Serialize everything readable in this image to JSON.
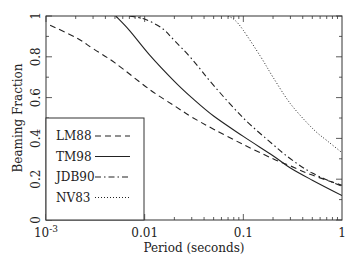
{
  "chart_data": {
    "type": "line",
    "title": "",
    "xlabel": "Period (seconds)",
    "ylabel": "Beaming Fraction",
    "xscale": "log",
    "xlim": [
      0.001,
      1
    ],
    "ylim": [
      0,
      1
    ],
    "grid": false,
    "legend_position": "lower-left",
    "x_ticks": [
      {
        "value": 0.001,
        "label": "10",
        "sup": "-3"
      },
      {
        "value": 0.01,
        "label": "0.01",
        "sup": ""
      },
      {
        "value": 0.1,
        "label": "0.1",
        "sup": ""
      },
      {
        "value": 1,
        "label": "1",
        "sup": ""
      }
    ],
    "y_ticks": [
      {
        "value": 0,
        "label": "0"
      },
      {
        "value": 0.2,
        "label": "0.2"
      },
      {
        "value": 0.4,
        "label": "0.4"
      },
      {
        "value": 0.6,
        "label": "0.6"
      },
      {
        "value": 0.8,
        "label": "0.8"
      },
      {
        "value": 1,
        "label": "1"
      }
    ],
    "series": [
      {
        "name": "LM88",
        "style": "dashed",
        "x": [
          0.0011,
          0.002,
          0.003,
          0.005,
          0.0112,
          0.02,
          0.03,
          0.05,
          0.1,
          0.2,
          0.3,
          0.5,
          1.0
        ],
        "y": [
          0.955,
          0.895,
          0.84,
          0.77,
          0.64,
          0.56,
          0.505,
          0.445,
          0.37,
          0.3,
          0.265,
          0.22,
          0.17
        ]
      },
      {
        "name": "TM98",
        "style": "solid",
        "x": [
          0.0051,
          0.007,
          0.0112,
          0.02,
          0.03,
          0.05,
          0.1,
          0.2,
          0.3,
          0.5,
          1.0
        ],
        "y": [
          1.0,
          0.93,
          0.81,
          0.68,
          0.6,
          0.51,
          0.41,
          0.315,
          0.255,
          0.195,
          0.12
        ]
      },
      {
        "name": "JDB90",
        "style": "dash-dot",
        "x": [
          0.007,
          0.01,
          0.015,
          0.02,
          0.03,
          0.05,
          0.1,
          0.2,
          0.3,
          0.5,
          1.0
        ],
        "y": [
          1.0,
          0.985,
          0.94,
          0.88,
          0.79,
          0.66,
          0.5,
          0.37,
          0.3,
          0.23,
          0.165
        ]
      },
      {
        "name": "NV83",
        "style": "dotted",
        "x": [
          0.07,
          0.082,
          0.1,
          0.15,
          0.2,
          0.3,
          0.5,
          0.7,
          1.0
        ],
        "y": [
          1.0,
          0.98,
          0.93,
          0.8,
          0.7,
          0.57,
          0.45,
          0.39,
          0.33
        ]
      }
    ]
  }
}
